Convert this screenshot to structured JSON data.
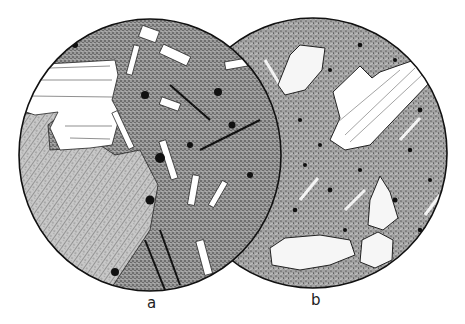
{
  "figure": {
    "type": "petrographic thin-section drawings",
    "panels": [
      {
        "id": "a",
        "label": "a",
        "description": "Coarse texture with large striated phenocryst, cleaved crystal region, and lath-shaped crystals in a dense stippled groundmass with opaque black grains"
      },
      {
        "id": "b",
        "label": "b",
        "description": "Fine-grained stippled groundmass with microlites and dark grains, a large striated tabular phenocryst and several rounded fractured crystals"
      }
    ]
  },
  "colors": {
    "ink": "#111111",
    "groundmass": "#8a8a8a",
    "paper": "#ffffff"
  }
}
